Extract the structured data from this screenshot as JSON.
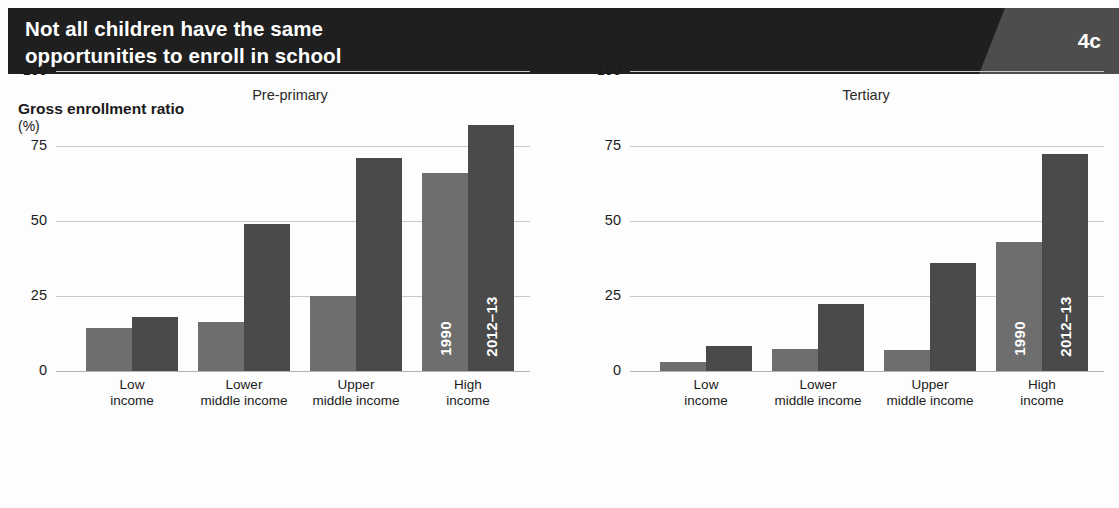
{
  "header": {
    "title_line1": "Not all children have the same",
    "title_line2": "opportunities to enroll in school",
    "badge": "4c",
    "bg_color": "#1f1f1f",
    "badge_bg_color": "#4d4d4d"
  },
  "axis_caption": {
    "line1": "Gross enrollment ratio",
    "line2": "(%)"
  },
  "series_labels": {
    "first": "1990",
    "second": "2012–13"
  },
  "colors": {
    "bar_1990": "#6e6e6e",
    "bar_2012": "#4a4a4a",
    "gridline": "#c9c9c9",
    "zeroline": "#b2b2b2"
  },
  "chart_data": [
    {
      "type": "bar",
      "title": "Pre-primary",
      "xlabel": "",
      "ylabel": "Gross enrollment ratio (%)",
      "ylim": [
        0,
        100
      ],
      "yticks": [
        0,
        25,
        50,
        75,
        100
      ],
      "ytick_labels": [
        "0",
        "25",
        "50",
        "75",
        "100"
      ],
      "grid": true,
      "legend": "in-bar labels on High income group",
      "categories": [
        "Low income",
        "Lower middle income",
        "Upper middle income",
        "High income"
      ],
      "category_lines": [
        [
          "Low",
          "income"
        ],
        [
          "Lower",
          "middle income"
        ],
        [
          "Upper",
          "middle income"
        ],
        [
          "High",
          "income"
        ]
      ],
      "series": [
        {
          "name": "1990",
          "values": [
            14.5,
            16.5,
            25,
            66
          ]
        },
        {
          "name": "2012–13",
          "values": [
            18,
            49,
            71,
            82
          ]
        }
      ]
    },
    {
      "type": "bar",
      "title": "Tertiary",
      "xlabel": "",
      "ylabel": "Gross enrollment ratio (%)",
      "ylim": [
        0,
        100
      ],
      "yticks": [
        0,
        25,
        50,
        75,
        100
      ],
      "ytick_labels": [
        "0",
        "25",
        "50",
        "75",
        "100"
      ],
      "grid": true,
      "legend": "in-bar labels on High income group",
      "categories": [
        "Low income",
        "Lower middle income",
        "Upper middle income",
        "High income"
      ],
      "category_lines": [
        [
          "Low",
          "income"
        ],
        [
          "Lower",
          "middle income"
        ],
        [
          "Upper",
          "middle income"
        ],
        [
          "High",
          "income"
        ]
      ],
      "series": [
        {
          "name": "1990",
          "values": [
            3,
            7.5,
            7,
            43
          ]
        },
        {
          "name": "2012–13",
          "values": [
            8.5,
            22.5,
            36,
            72.5
          ]
        }
      ]
    }
  ]
}
